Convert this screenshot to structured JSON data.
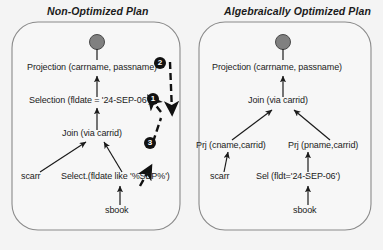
{
  "figure": {
    "background_color": "#f4f4f4",
    "panel_border_color": "#8a8a8a",
    "panel_fill_color": "#f7f7f7",
    "node_dot_color": "#808080",
    "arrow_color": "#1b1b1b",
    "badge_color": "#111111",
    "text_color": "#1b1b1b"
  },
  "panels": [
    {
      "id": "non-optimized",
      "title": "Non-Optimized Plan",
      "root_marker": "filled-circle",
      "nodes": [
        {
          "id": "projection",
          "label": "Projection (carrname, passname)"
        },
        {
          "id": "selection",
          "label": "Selection (fldate = '24-SEP-06')"
        },
        {
          "id": "join",
          "label": "Join (via carrid)"
        },
        {
          "id": "scarr",
          "label": "scarr"
        },
        {
          "id": "select2",
          "label": "Select.(fldate like '%SEP%')"
        },
        {
          "id": "sbook",
          "label": "sbook"
        }
      ],
      "edges": [
        {
          "from": "selection",
          "to": "projection"
        },
        {
          "from": "join",
          "to": "selection"
        },
        {
          "from": "scarr",
          "to": "join"
        },
        {
          "from": "select2",
          "to": "join"
        },
        {
          "from": "sbook",
          "to": "select2"
        }
      ],
      "annotations": [
        {
          "id": "step-2",
          "label": "2"
        },
        {
          "id": "step-1",
          "label": "1"
        },
        {
          "id": "step-3",
          "label": "3"
        }
      ]
    },
    {
      "id": "optimized",
      "title": "Algebraically Optimized Plan",
      "root_marker": "filled-circle",
      "nodes": [
        {
          "id": "projection",
          "label": "Projection (carrname, passname)"
        },
        {
          "id": "join",
          "label": "Join (via carrid)"
        },
        {
          "id": "prj-left",
          "label": "Prj (cname,carrid)"
        },
        {
          "id": "prj-right",
          "label": "Prj (pname,carrid)"
        },
        {
          "id": "scarr",
          "label": "scarr"
        },
        {
          "id": "sel",
          "label": "Sel (fldt='24-SEP-06')"
        },
        {
          "id": "sbook",
          "label": "sbook"
        }
      ],
      "edges": [
        {
          "from": "join",
          "to": "projection"
        },
        {
          "from": "prj-left",
          "to": "join"
        },
        {
          "from": "prj-right",
          "to": "join"
        },
        {
          "from": "scarr",
          "to": "prj-left"
        },
        {
          "from": "sel",
          "to": "prj-right"
        },
        {
          "from": "sbook",
          "to": "sel"
        }
      ]
    }
  ]
}
